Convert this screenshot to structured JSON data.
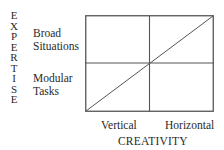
{
  "diagram": {
    "y_axis_title": "EXPERTISE",
    "y_axis_letters": [
      "E",
      "X",
      "P",
      "E",
      "R",
      "T",
      "I",
      "S",
      "E"
    ],
    "x_axis_title": "CREATIVITY",
    "rows": [
      {
        "label_line1": "Broad",
        "label_line2": "Situations"
      },
      {
        "label_line1": "Modular",
        "label_line2": "Tasks"
      }
    ],
    "columns": [
      {
        "label": "Vertical"
      },
      {
        "label": "Horizontal"
      }
    ],
    "grid": {
      "rows": 2,
      "cols": 2,
      "diagonal": "bottom-left to top-right"
    },
    "line_color": "#555555"
  }
}
